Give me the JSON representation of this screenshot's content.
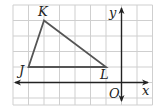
{
  "diagram": {
    "type": "coordinate-grid-triangle",
    "grid": {
      "x_lines": [
        13,
        28.5,
        44,
        59.5,
        75,
        90.5,
        106,
        121.5,
        137,
        152.5
      ],
      "y_lines": [
        5,
        20.5,
        36,
        51.5,
        67,
        82.5,
        98
      ],
      "color": "#cfcfcf"
    },
    "axes": {
      "x_label": "x",
      "y_label": "y",
      "origin_label": "O",
      "color": "#222222"
    },
    "triangle": {
      "color": "#555555",
      "vertices": [
        {
          "name": "K",
          "grid": [
            -5,
            4
          ]
        },
        {
          "name": "J",
          "grid": [
            -6,
            1
          ]
        },
        {
          "name": "L",
          "grid": [
            -1,
            1
          ]
        }
      ]
    },
    "labels": {
      "K": "K",
      "J": "J",
      "L": "L",
      "O": "O",
      "x": "x",
      "y": "y"
    }
  }
}
